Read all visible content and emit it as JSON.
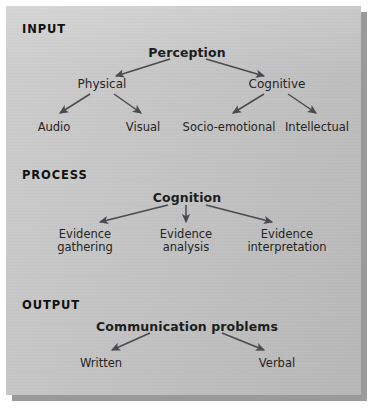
{
  "figure": {
    "panel_background": "#c9c9c9",
    "text_color": "#1d1d1d",
    "arrow_color": "#4a4a50"
  },
  "sections": [
    {
      "id": "input",
      "label": "INPUT"
    },
    {
      "id": "process",
      "label": "PROCESS"
    },
    {
      "id": "output",
      "label": "OUTPUT"
    }
  ],
  "input": {
    "root": "Perception",
    "branches": [
      {
        "label": "Physical",
        "children": [
          "Audio",
          "Visual"
        ]
      },
      {
        "label": "Cognitive",
        "children": [
          "Socio-emotional",
          "Intellectual"
        ]
      }
    ]
  },
  "process": {
    "root": "Cognition",
    "children": [
      {
        "line1": "Evidence",
        "line2": "gathering"
      },
      {
        "line1": "Evidence",
        "line2": "analysis"
      },
      {
        "line1": "Evidence",
        "line2": "interpretation"
      }
    ]
  },
  "output": {
    "root": "Communication problems",
    "children": [
      "Written",
      "Verbal"
    ]
  },
  "diagram_data": {
    "type": "tree",
    "levels": 3,
    "nodes": [
      "Perception",
      "Physical",
      "Cognitive",
      "Audio",
      "Visual",
      "Socio-emotional",
      "Intellectual",
      "Cognition",
      "Evidence gathering",
      "Evidence analysis",
      "Evidence interpretation",
      "Communication problems",
      "Written",
      "Verbal"
    ],
    "edges": [
      [
        "Perception",
        "Physical"
      ],
      [
        "Perception",
        "Cognitive"
      ],
      [
        "Physical",
        "Audio"
      ],
      [
        "Physical",
        "Visual"
      ],
      [
        "Cognitive",
        "Socio-emotional"
      ],
      [
        "Cognitive",
        "Intellectual"
      ],
      [
        "Cognition",
        "Evidence gathering"
      ],
      [
        "Cognition",
        "Evidence analysis"
      ],
      [
        "Cognition",
        "Evidence interpretation"
      ],
      [
        "Communication problems",
        "Written"
      ],
      [
        "Communication problems",
        "Verbal"
      ]
    ]
  }
}
